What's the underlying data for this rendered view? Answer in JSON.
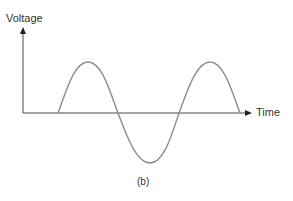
{
  "diagram": {
    "y_axis_label": "Voltage",
    "x_axis_label": "Time",
    "caption": "(b)",
    "colors": {
      "axis": "#4a4a4a",
      "wave": "#8c8c8c",
      "text": "#333333"
    },
    "waveform": {
      "type": "sine",
      "cycles": 1.5,
      "starts_at_x_axis": true,
      "sequence": [
        "positive half-cycle",
        "negative half-cycle",
        "positive half-cycle"
      ]
    }
  }
}
